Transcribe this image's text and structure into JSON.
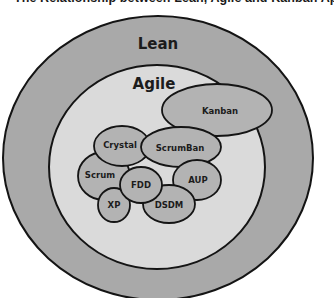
{
  "title": "The Relationship between Lean, Agile and Kanban Approaches",
  "colors": {
    "lean_fill": "#a9a9a9",
    "agile_fill": "#dadada",
    "method_fill": "#b3b3b3",
    "outline": "#141414",
    "background": "#ffffff"
  },
  "diagram": {
    "outer": {
      "label": "Lean"
    },
    "middle": {
      "label": "Agile"
    },
    "methods": [
      {
        "id": "kanban",
        "label": "Kanban"
      },
      {
        "id": "crystal",
        "label": "Crystal"
      },
      {
        "id": "scrumban",
        "label": "ScrumBan"
      },
      {
        "id": "scrum",
        "label": "Scrum"
      },
      {
        "id": "fdd",
        "label": "FDD"
      },
      {
        "id": "xp",
        "label": "XP"
      },
      {
        "id": "aup",
        "label": "AUP"
      },
      {
        "id": "dsdm",
        "label": "DSDM"
      }
    ],
    "relationships": [
      {
        "from": "Agile",
        "to": "Lean",
        "relation": "contained-in"
      },
      {
        "from": "Kanban",
        "to": "Agile",
        "relation": "overlaps"
      },
      {
        "from": "ScrumBan",
        "to": "Kanban",
        "relation": "overlaps"
      },
      {
        "from": "ScrumBan",
        "to": "Crystal",
        "relation": "overlaps"
      }
    ]
  }
}
